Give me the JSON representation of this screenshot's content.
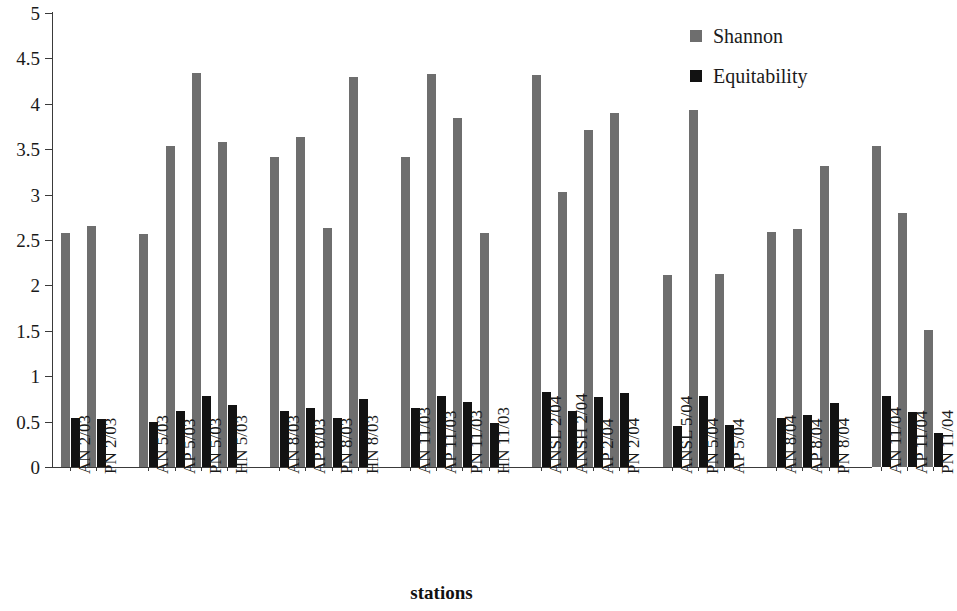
{
  "chart_data": {
    "type": "bar",
    "title": "",
    "xlabel": "stations",
    "ylabel": "",
    "ylim": [
      0,
      5
    ],
    "ytick_step": 0.5,
    "ytick_labels": [
      "0",
      "0.5",
      "1",
      "1.5",
      "2",
      "2.5",
      "3",
      "3.5",
      "4",
      "4.5",
      "5"
    ],
    "grid": false,
    "legend_position": "top-right",
    "colors": {
      "shannon": "#6e6e6e",
      "equitability": "#121212",
      "axis": "#3a3a3a",
      "text": "#1a1a1a"
    },
    "categories": [
      "AN 2/03",
      "PN 2/03",
      "AN 5/03",
      "AP 5/03",
      "PN 5/03",
      "HN 5/03",
      "AN 8/03",
      "AP 8/03",
      "PN 8/03",
      "HN 8/03",
      "AN 11/03",
      "AP 11/03",
      "PN 11/03",
      "HN 11/03",
      "ANSL 2/04",
      "ANSH 2/04",
      "AP 2/04",
      "PN 2/04",
      "ANSL 5/04",
      "PN 5/04",
      "AP 5/04",
      "AN 8/04",
      "AP 8/04",
      "PN 8/04",
      "AN 11/04",
      "AP 11/04",
      "PN 11/04"
    ],
    "group_breaks": [
      2,
      6,
      10,
      14,
      18,
      21,
      24
    ],
    "series": [
      {
        "name": "Shannon",
        "color": "#6e6e6e",
        "values": [
          2.58,
          2.65,
          2.57,
          3.54,
          4.34,
          3.58,
          3.41,
          3.64,
          2.63,
          4.3,
          3.41,
          4.33,
          3.84,
          2.58,
          4.32,
          3.03,
          3.71,
          3.9,
          2.11,
          3.93,
          2.13,
          2.59,
          2.62,
          3.31,
          3.54,
          2.8,
          1.51
        ]
      },
      {
        "name": "Equitability",
        "color": "#121212",
        "values": [
          0.54,
          0.53,
          0.5,
          0.62,
          0.78,
          0.68,
          0.62,
          0.65,
          0.54,
          0.75,
          0.65,
          0.78,
          0.72,
          0.49,
          0.83,
          0.62,
          0.77,
          0.81,
          0.45,
          0.78,
          0.46,
          0.54,
          0.57,
          0.71,
          0.78,
          0.61,
          0.37
        ]
      }
    ]
  },
  "legend": {
    "items": [
      {
        "label": "Shannon",
        "color": "#6e6e6e"
      },
      {
        "label": "Equitability",
        "color": "#121212"
      }
    ]
  },
  "axis": {
    "x_title": "stations"
  }
}
